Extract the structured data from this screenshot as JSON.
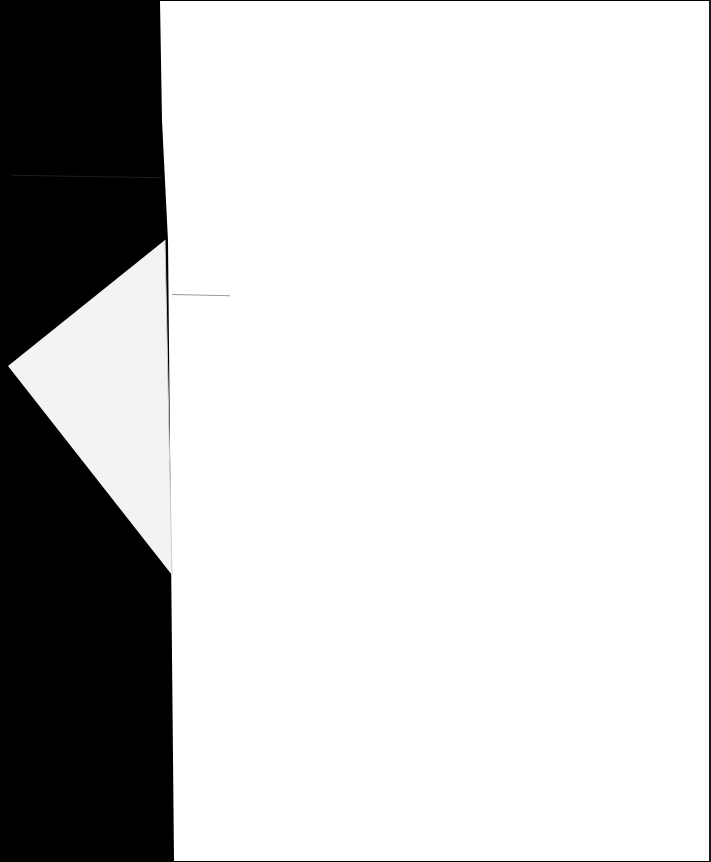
{
  "document": {
    "type": "scanned-page",
    "content": "",
    "colors": {
      "background": "#000000",
      "paper": "#ffffff",
      "fold": "#f4f4f4",
      "faint_mark": "#9a9a9a"
    }
  }
}
